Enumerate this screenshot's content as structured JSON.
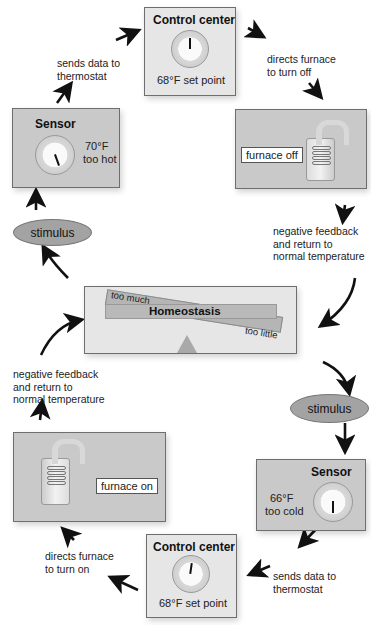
{
  "diagram": {
    "top_loop": {
      "control_center": {
        "title": "Control center",
        "caption": "68°F set point"
      },
      "sensor": {
        "title": "Sensor",
        "reading": "70°F",
        "status": "too hot"
      },
      "effector": {
        "tag": "furnace off"
      },
      "step_sends_data": "sends data to\nthermostat",
      "step_directs": "directs furnace\nto turn off",
      "step_feedback": "negative feedback\nand return to\nnormal temperature",
      "stimulus": "stimulus"
    },
    "center": {
      "title": "Homeostasis",
      "left_label": "too much",
      "right_label": "too little"
    },
    "bottom_loop": {
      "stimulus": "stimulus",
      "sensor": {
        "title": "Sensor",
        "reading": "66°F",
        "status": "too cold"
      },
      "step_sends_data": "sends data to\nthermostat",
      "control_center": {
        "title": "Control center",
        "caption": "68°F set point"
      },
      "step_directs": "directs furnace\nto turn on",
      "effector": {
        "tag": "furnace on"
      },
      "step_feedback": "negative feedback\nand return to\nnormal temperature"
    },
    "colors": {
      "panel": "#c9c9c9",
      "panel_light": "#e6e6e6",
      "ellipse": "#a3a3a3",
      "arrow": "#111111"
    }
  }
}
